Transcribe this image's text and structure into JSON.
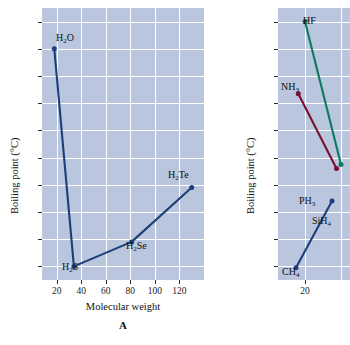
{
  "figure": {
    "panel_a_letter": "A"
  },
  "chart_data": [
    {
      "id": "panel-a",
      "type": "line",
      "title": "",
      "panel_label": "A",
      "xlabel": "Molecular weight",
      "ylabel": "Boiling point (°C)",
      "xlim": [
        8,
        140
      ],
      "ylim": [
        -70,
        130
      ],
      "xticks": [
        20,
        40,
        60,
        80,
        100,
        120
      ],
      "yticks": [
        120,
        100,
        80,
        60,
        40,
        20,
        0,
        -20,
        -40,
        -60
      ],
      "grid": true,
      "legend": "none",
      "plot_background": "#b9c6dd",
      "series": [
        {
          "name": "Group 16 hydrides",
          "color": "#1c3f7a",
          "x": [
            18,
            34,
            81,
            130
          ],
          "y": [
            100,
            -60,
            -42,
            -2
          ],
          "point_labels": [
            "H₂O",
            "H₂S",
            "H₂Se",
            "H₂Te"
          ]
        }
      ],
      "annotations": [
        {
          "text": "H2O",
          "html": "H<sub>2</sub>O",
          "x": 18,
          "y": 100
        },
        {
          "text": "H2S",
          "html": "H<sub>2</sub>S",
          "x": 34,
          "y": -60
        },
        {
          "text": "H2Se",
          "html": "H<sub>2</sub>Se",
          "x": 81,
          "y": -42
        },
        {
          "text": "H2Te",
          "html": "H<sub>2</sub>Te",
          "x": 130,
          "y": -2
        }
      ]
    },
    {
      "id": "panel-b",
      "type": "line",
      "title": "",
      "panel_label": "",
      "xlabel": "",
      "ylabel": "Boiling point (°C)",
      "xlim": [
        8,
        40
      ],
      "ylim": [
        -170,
        30
      ],
      "xticks": [
        20
      ],
      "yticks": [
        20,
        0,
        -20,
        -40,
        -60,
        -80,
        -100,
        -120,
        -140,
        -160
      ],
      "grid": true,
      "legend": "none",
      "cropped": true,
      "plot_background": "#b9c6dd",
      "series": [
        {
          "name": "Group 17 hydrides",
          "color": "#0d7a5f",
          "x": [
            20,
            36
          ],
          "y": [
            20,
            -85
          ],
          "point_labels": [
            "HF",
            ""
          ]
        },
        {
          "name": "Group 15 hydrides",
          "color": "#7a1030",
          "x": [
            17,
            34
          ],
          "y": [
            -33,
            -88
          ],
          "point_labels": [
            "NH₃",
            "PH₃"
          ]
        },
        {
          "name": "Group 14 hydrides",
          "color": "#1c3f7a",
          "x": [
            16,
            32
          ],
          "y": [
            -161,
            -112
          ],
          "point_labels": [
            "CH₄",
            "SiH₄"
          ]
        }
      ],
      "annotations": [
        {
          "text": "HF",
          "html": "HF",
          "x": 20,
          "y": 20
        },
        {
          "text": "NH3",
          "html": "NH<sub>3</sub>",
          "x": 17,
          "y": -33
        },
        {
          "text": "PH3",
          "html": "PH<sub>3</sub>",
          "x": 34,
          "y": -88
        },
        {
          "text": "SiH4",
          "html": "SiH<sub>4</sub>",
          "x": 32,
          "y": -112
        },
        {
          "text": "CH4",
          "html": "CH<sub>4</sub>",
          "x": 16,
          "y": -161
        }
      ]
    }
  ],
  "panel_a": {
    "ylabel": "Boiling point (°C)",
    "xlabel": "Molecular weight",
    "letter": "A",
    "yticks": [
      "120",
      "100",
      "80",
      "60",
      "40",
      "20",
      "0",
      "–20",
      "–40",
      "–60"
    ],
    "xticks": [
      "20",
      "40",
      "60",
      "80",
      "100",
      "120"
    ],
    "labels": {
      "h2o": "H2O",
      "h2s": "H2S",
      "h2se": "H2Se",
      "h2te": "H2Te"
    }
  },
  "panel_b": {
    "ylabel": "Boiling point (°C)",
    "yticks": [
      "20",
      "0",
      "–20",
      "–40",
      "–60",
      "–80",
      "–100",
      "–120",
      "–140",
      "–160"
    ],
    "xticks": [
      "20"
    ],
    "labels": {
      "hf": "HF",
      "nh3": "NH3",
      "ph3": "PH3",
      "sih4": "SiH4",
      "ch4": "CH4"
    }
  }
}
